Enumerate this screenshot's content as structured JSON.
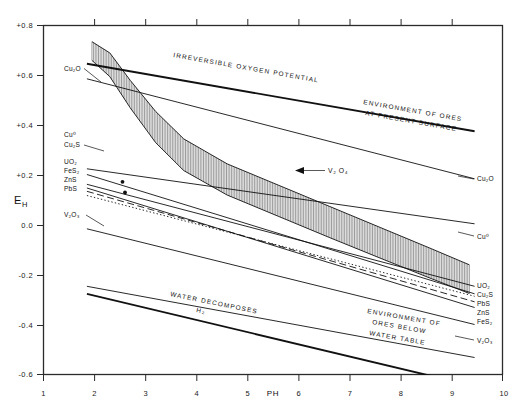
{
  "chart_data": {
    "type": "line",
    "title": "",
    "xlabel": "PH",
    "ylabel": "EH",
    "xlim": [
      1,
      10
    ],
    "ylim": [
      -0.6,
      0.8
    ],
    "grid": false,
    "legend_position": "inline-labels",
    "xticks": [
      "1",
      "2",
      "3",
      "4",
      "5",
      "6",
      "7",
      "8",
      "9",
      "10"
    ],
    "yticks": [
      "+0.8",
      "+0.6",
      "+0.4",
      "+0.2",
      "0.0",
      "-0.2",
      "-0.4",
      "-0.6"
    ],
    "series": [
      {
        "name": "Irreversible oxygen potential",
        "style": "thick-solid",
        "points": [
          [
            1.85,
            0.715
          ],
          [
            9.45,
            0.445
          ]
        ]
      },
      {
        "name": "Cu2O",
        "style": "solid",
        "points": [
          [
            1.85,
            0.655
          ],
          [
            9.45,
            0.255
          ]
        ]
      },
      {
        "name": "Cu0",
        "style": "solid",
        "points": [
          [
            1.85,
            0.295
          ],
          [
            9.45,
            0.075
          ]
        ]
      },
      {
        "name": "Cu2S",
        "style": "solid",
        "points": [
          [
            1.85,
            0.272
          ],
          [
            9.45,
            -0.205
          ]
        ]
      },
      {
        "name": "UO2",
        "style": "solid",
        "points": [
          [
            1.85,
            0.233
          ],
          [
            9.45,
            -0.175
          ]
        ]
      },
      {
        "name": "FeS2",
        "style": "solid",
        "points": [
          [
            1.85,
            0.218
          ],
          [
            9.45,
            -0.26
          ]
        ]
      },
      {
        "name": "ZnS",
        "style": "dashed",
        "points": [
          [
            1.85,
            0.205
          ],
          [
            9.45,
            -0.237
          ]
        ]
      },
      {
        "name": "PbS",
        "style": "dotted",
        "points": [
          [
            1.85,
            0.188
          ],
          [
            9.45,
            -0.215
          ]
        ]
      },
      {
        "name": "V2O3",
        "style": "solid",
        "points": [
          [
            1.85,
            0.055
          ],
          [
            9.45,
            -0.33
          ]
        ]
      },
      {
        "name": "Water decomposes H2",
        "style": "thick-solid",
        "points": [
          [
            1.85,
            -0.175
          ],
          [
            9.45,
            -0.545
          ]
        ]
      },
      {
        "name": "Environment of ores below water table",
        "style": "solid",
        "points": [
          [
            1.85,
            -0.145
          ],
          [
            9.45,
            -0.43
          ]
        ]
      }
    ],
    "band": {
      "name": "V2O4 stability band",
      "fill": "vertical-hatch",
      "upper": [
        [
          1.95,
          0.735
        ],
        [
          2.3,
          0.69
        ],
        [
          2.7,
          0.58
        ],
        [
          3.2,
          0.455
        ],
        [
          3.75,
          0.345
        ],
        [
          4.6,
          0.245
        ],
        [
          5.6,
          0.16
        ],
        [
          6.6,
          0.075
        ],
        [
          7.6,
          -0.01
        ],
        [
          8.6,
          -0.095
        ],
        [
          9.35,
          -0.16
        ]
      ],
      "lower": [
        [
          1.95,
          0.66
        ],
        [
          2.3,
          0.595
        ],
        [
          2.7,
          0.47
        ],
        [
          3.2,
          0.33
        ],
        [
          3.75,
          0.218
        ],
        [
          4.6,
          0.12
        ],
        [
          5.6,
          0.035
        ],
        [
          6.6,
          -0.05
        ],
        [
          7.6,
          -0.133
        ],
        [
          8.6,
          -0.215
        ],
        [
          9.35,
          -0.275
        ]
      ]
    },
    "markers": [
      {
        "label": "",
        "x": 2.55,
        "y": 0.243
      },
      {
        "label": "",
        "x": 2.6,
        "y": 0.2
      }
    ],
    "annotations": [
      {
        "id": "irreversible-oxygen-potential",
        "text": "IRREVERSIBLE OXYGEN POTENTIAL"
      },
      {
        "id": "environment-present-surface",
        "text": "ENVIRONMENT OF ORES"
      },
      {
        "id": "environment-present-surface-2",
        "text": "AT PRESENT SURFACE"
      },
      {
        "id": "water-decomposes",
        "text": "WATER DECOMPOSES"
      },
      {
        "id": "water-decomposes-h2",
        "text": "H₂"
      },
      {
        "id": "environment-below-1",
        "text": "ENVIRONMENT OF"
      },
      {
        "id": "environment-below-2",
        "text": "ORES BELOW"
      },
      {
        "id": "environment-below-3",
        "text": "WATER TABLE"
      },
      {
        "id": "v2o4",
        "text": "V₂ O₄"
      }
    ],
    "left_labels": [
      {
        "text": "Cu₂O",
        "y": 0.615
      },
      {
        "text": "Cu⁰",
        "y": 0.305
      },
      {
        "text": "Cu₂S",
        "y": 0.272
      },
      {
        "text": "UO₂",
        "y": 0.233
      },
      {
        "text": "FeS₂",
        "y": 0.207
      },
      {
        "text": "ZnS",
        "y": 0.181
      },
      {
        "text": "PbS",
        "y": 0.155
      },
      {
        "text": "V₂O₃",
        "y": 0.055
      }
    ],
    "right_labels": [
      {
        "text": "Cu₂O",
        "y": 0.255
      },
      {
        "text": "Cu⁰",
        "y": 0.075
      },
      {
        "text": "UO₂",
        "y": -0.175
      },
      {
        "text": "Cu₂S",
        "y": -0.205
      },
      {
        "text": "PbS",
        "y": -0.215
      },
      {
        "text": "ZnS",
        "y": -0.237
      },
      {
        "text": "FeS₂",
        "y": -0.26
      },
      {
        "text": "V₂O₃",
        "y": -0.33
      }
    ]
  },
  "axes": {
    "y_title": "E",
    "y_title_sub": "H",
    "x_title": "PH"
  }
}
